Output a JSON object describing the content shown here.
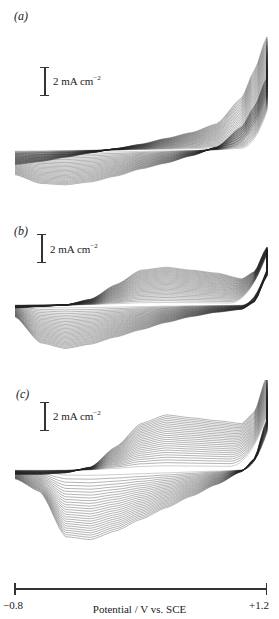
{
  "chart_data": [
    {
      "type": "line",
      "panel_label": "(a)",
      "title": "",
      "scale_bar": "2 mA cm-2",
      "xlabel": "Potential / V vs. SCE",
      "xlim": [
        -0.8,
        1.2
      ],
      "description": "Repeated potentiodynamic cycles; currents increase with cycle number; steep anodic rise above ~+0.9 V; broad cathodic wave at negative potentials",
      "series_count": 25,
      "envelope": {
        "x": [
          -0.8,
          -0.6,
          -0.4,
          -0.2,
          0.0,
          0.2,
          0.4,
          0.6,
          0.8,
          1.0,
          1.1,
          1.2
        ],
        "upper_last_cycle_mA": [
          -1.0,
          -0.8,
          -0.5,
          -0.2,
          0.1,
          0.4,
          0.8,
          1.2,
          1.8,
          3.6,
          5.5,
          7.8
        ],
        "lower_last_cycle_mA": [
          -1.7,
          -2.3,
          -2.4,
          -2.2,
          -1.8,
          -1.3,
          -0.9,
          -0.4,
          0.2,
          1.6,
          3.0,
          5.0
        ]
      }
    },
    {
      "type": "line",
      "panel_label": "(b)",
      "title": "",
      "scale_bar": "2 mA cm-2",
      "xlabel": "Potential / V vs. SCE",
      "xlim": [
        -0.8,
        1.2
      ],
      "description": "Growth of broad anodic wave (~0.1–0.6 V) and cathodic wave (~-0.6 V) with cycling",
      "series_count": 30,
      "envelope": {
        "x": [
          -0.8,
          -0.6,
          -0.4,
          -0.2,
          0.0,
          0.2,
          0.4,
          0.6,
          0.8,
          1.0,
          1.1,
          1.2
        ],
        "upper_last_cycle_mA": [
          -0.2,
          -0.1,
          0.0,
          0.4,
          1.4,
          2.4,
          2.6,
          2.4,
          2.2,
          1.8,
          2.3,
          4.0
        ],
        "lower_last_cycle_mA": [
          -0.8,
          -2.6,
          -3.0,
          -2.7,
          -2.2,
          -1.7,
          -1.2,
          -0.8,
          -0.5,
          -0.3,
          0.2,
          2.0
        ]
      }
    },
    {
      "type": "line",
      "panel_label": "(c)",
      "title": "",
      "scale_bar": "2 mA cm-2",
      "xlabel": "Potential / V vs. SCE",
      "xlim": [
        -0.8,
        1.2
      ],
      "description": "Larger anodic wave with plateau ~0.3–0.9 V and sharp cathodic peak ~-0.5 V; first cycle flat",
      "series_count": 25,
      "envelope": {
        "x": [
          -0.8,
          -0.6,
          -0.4,
          -0.2,
          0.0,
          0.2,
          0.4,
          0.6,
          0.8,
          1.0,
          1.1,
          1.2
        ],
        "upper_last_cycle_mA": [
          -0.3,
          -0.3,
          -0.2,
          0.2,
          1.6,
          3.2,
          3.8,
          3.6,
          3.4,
          3.2,
          4.0,
          6.5
        ],
        "lower_last_cycle_mA": [
          -0.6,
          -1.5,
          -4.6,
          -4.8,
          -4.2,
          -3.4,
          -2.6,
          -1.8,
          -1.0,
          -0.1,
          0.8,
          3.5
        ]
      }
    }
  ],
  "panels": [
    {
      "label": "(a)",
      "scale_bar_text": "2 mA cm",
      "scale_bar_exp": "−2"
    },
    {
      "label": "(b)",
      "scale_bar_text": "2 mA cm",
      "scale_bar_exp": "−2"
    },
    {
      "label": "(c)",
      "scale_bar_text": "2 mA cm",
      "scale_bar_exp": "−2"
    }
  ],
  "axis": {
    "min_label": "−0.8",
    "max_label": "+1.2",
    "label": "Potential / V vs. SCE"
  }
}
